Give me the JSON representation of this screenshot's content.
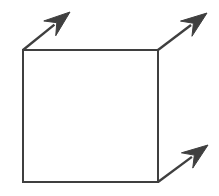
{
  "canvas": {
    "width": 219,
    "height": 196,
    "background_color": "#ffffff",
    "title": "Square with three outward arrows"
  },
  "style": {
    "stroke_color": "#3f3f3f",
    "arrow_fill_color": "#3f3f3f",
    "square_stroke_width": 2.4,
    "arrow_shaft_stroke_width": 2.4
  },
  "figure": {
    "type": "diagram",
    "description": "An open square outline drawn in dark gray, with three straight arrows pointing up and to the right at roughly 45 degrees, emanating from the top-left, top-right and bottom-right corners of the square.",
    "square": {
      "name": "square-outline",
      "left": 23,
      "top": 50,
      "right": 158,
      "bottom": 182,
      "width": 135,
      "height": 132,
      "fill": "none"
    },
    "arrows": [
      {
        "name": "arrow-top-left",
        "label": "top-left outward arrow",
        "origin_corner": "top-left",
        "start_x": 23,
        "start_y": 50,
        "end_x": 70,
        "end_y": 12,
        "angle_degrees": 39,
        "direction": "up-right"
      },
      {
        "name": "arrow-top-right",
        "label": "top-right outward arrow",
        "origin_corner": "top-right",
        "start_x": 158,
        "start_y": 50,
        "end_x": 207,
        "end_y": 13,
        "angle_degrees": 37,
        "direction": "up-right"
      },
      {
        "name": "arrow-bottom-right",
        "label": "bottom-right outward arrow",
        "origin_corner": "bottom-right",
        "start_x": 158,
        "start_y": 182,
        "end_x": 208,
        "end_y": 145,
        "angle_degrees": 36,
        "direction": "up-right"
      }
    ]
  }
}
